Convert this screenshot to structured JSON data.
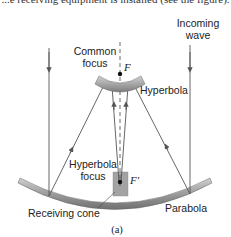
{
  "top_text": "...e receiving equipment is installed (see the figure).",
  "labels": {
    "incoming_wave_line1": "Incoming",
    "incoming_wave_line2": "wave",
    "common_focus_line1": "Common",
    "common_focus_line2": "focus",
    "focus_F": "F",
    "hyperbola": "Hyperbola",
    "hyperbola_focus_line1": "Hyperbola",
    "hyperbola_focus_line2": "focus",
    "focus_F_prime": "F′",
    "receiving_cone": "Receiving cone",
    "parabola": "Parabola"
  },
  "subfigure_label": "(a)",
  "colors": {
    "reflector": "#8a8a8a",
    "reflector_light": "#c8c8c8",
    "rays": "#555555",
    "cone": "#9a9a9a"
  }
}
